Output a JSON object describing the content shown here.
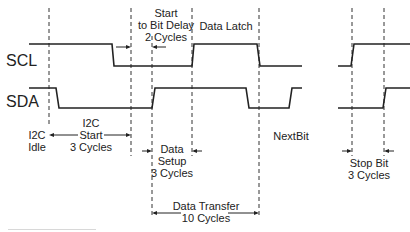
{
  "signals": {
    "scl": {
      "name": "SCL"
    },
    "sda": {
      "name": "SDA"
    }
  },
  "annotations": {
    "start_to_bit_delay": {
      "line1": "Start",
      "line2": "to Bit Delay",
      "line3": "2 Cycles"
    },
    "data_latch": {
      "label": "Data Latch"
    },
    "i2c_idle": {
      "line1": "I2C",
      "line2": "Idle"
    },
    "i2c_start": {
      "line1": "I2C",
      "line2": "Start",
      "line3": "3 Cycles"
    },
    "data_setup": {
      "line1": "Data",
      "line2": "Setup",
      "line3": "3 Cycles"
    },
    "next_bit": {
      "label": "NextBit"
    },
    "stop_bit": {
      "line1": "Stop Bit",
      "line2": "3 Cycles"
    },
    "data_transfer": {
      "line1": "Data Transfer",
      "line2": "10 Cycles"
    }
  },
  "colors": {
    "line": "#222222",
    "background": "#ffffff"
  }
}
